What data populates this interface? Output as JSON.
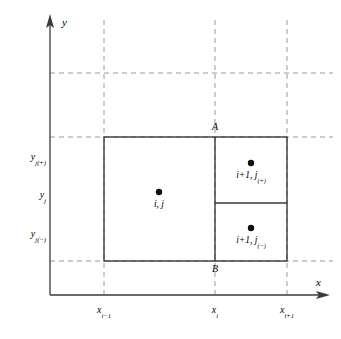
{
  "figure": {
    "background": "#ffffff",
    "line_color": "#3a3a3a",
    "dash_color": "#9a9a9a",
    "width": 341,
    "height": 339
  },
  "axes": {
    "x_label": "x",
    "y_label": "y",
    "origin": {
      "x": 50,
      "y": 295
    }
  },
  "x_ticks": [
    {
      "label_base": "x",
      "label_sub": "i−1",
      "px": 104
    },
    {
      "label_base": "x",
      "label_sub": "i",
      "px": 215
    },
    {
      "label_base": "x",
      "label_sub": "i+1",
      "px": 287
    }
  ],
  "y_ticks": [
    {
      "label_base": "y",
      "label_sub": "j(+)",
      "px": 158
    },
    {
      "label_base": "y",
      "label_sub": "j",
      "px": 196
    },
    {
      "label_base": "y",
      "label_sub": "j(−)",
      "px": 235
    }
  ],
  "cells": [
    {
      "name": "center-cell",
      "label_main": "i, j",
      "label_sub": "",
      "dot_x": 159,
      "dot_y": 192
    },
    {
      "name": "upper-right-cell",
      "label_main": "i+1, j",
      "label_sub": "(+)",
      "dot_x": 251,
      "dot_y": 163
    },
    {
      "name": "lower-right-cell",
      "label_main": "i+1, j",
      "label_sub": "(−)",
      "dot_x": 251,
      "dot_y": 228
    }
  ],
  "points": [
    {
      "name": "point-a",
      "label": "A",
      "x": 215,
      "y": 130
    },
    {
      "name": "point-b",
      "label": "B",
      "x": 215,
      "y": 270
    }
  ],
  "rectangles": {
    "outer": {
      "left": 104,
      "top": 137,
      "right": 287,
      "bottom": 261
    },
    "vertical_divider_x": 215,
    "horizontal_divider_y": 203
  },
  "grid": {
    "vertical_dashed_x": [
      104,
      215,
      287
    ],
    "horizontal_dashed_y": [
      73,
      137,
      261
    ]
  }
}
